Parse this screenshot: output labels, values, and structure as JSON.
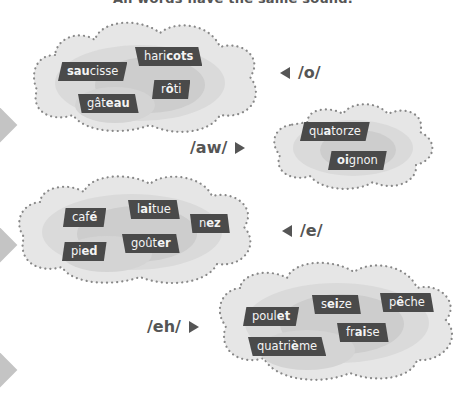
{
  "caption": "All words have the same sound.",
  "groups": [
    {
      "sound": "/o/",
      "words": [
        {
          "pre": "",
          "bold": "sau",
          "post": "cisse"
        },
        {
          "pre": "hari",
          "bold": "cots",
          "post": ""
        },
        {
          "pre": "r",
          "bold": "ô",
          "post": "ti"
        },
        {
          "pre": "gât",
          "bold": "eau",
          "post": ""
        }
      ]
    },
    {
      "sound": "/aw/",
      "words": [
        {
          "pre": "qu",
          "bold": "a",
          "post": "torze"
        },
        {
          "pre": "",
          "bold": "oi",
          "post": "gnon"
        }
      ]
    },
    {
      "sound": "/e/",
      "words": [
        {
          "pre": "caf",
          "bold": "é",
          "post": ""
        },
        {
          "pre": "l",
          "bold": "ai",
          "post": "tue"
        },
        {
          "pre": "n",
          "bold": "ez",
          "post": ""
        },
        {
          "pre": "pi",
          "bold": "ed",
          "post": ""
        },
        {
          "pre": "goût",
          "bold": "er",
          "post": ""
        }
      ]
    },
    {
      "sound": "/eh/",
      "words": [
        {
          "pre": "poul",
          "bold": "et",
          "post": ""
        },
        {
          "pre": "s",
          "bold": "ei",
          "post": "ze"
        },
        {
          "pre": "p",
          "bold": "ê",
          "post": "che"
        },
        {
          "pre": "fr",
          "bold": "ai",
          "post": "se"
        },
        {
          "pre": "quatri",
          "bold": "è",
          "post": "me"
        }
      ]
    }
  ],
  "colors": {
    "cloud_light": "#e6e6e6",
    "cloud_mid": "#d6d6d6",
    "cloud_dark": "#c6c6c6",
    "dots": "#888888",
    "label_bg": "#4a4a4a",
    "label_text": "#f4f4f4",
    "sound_text": "#555555"
  }
}
